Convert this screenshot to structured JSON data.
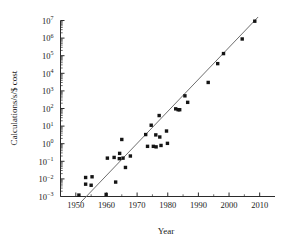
{
  "chart_data": {
    "type": "scatter",
    "title": "",
    "xlabel": "Year",
    "ylabel": "Calculations/s/$ cost",
    "xlim": [
      1945,
      2015
    ],
    "ylim_exp": [
      -3,
      7
    ],
    "yscale": "log",
    "grid": false,
    "legend": "none",
    "x_ticks": [
      1950,
      1960,
      1970,
      1980,
      1990,
      2000,
      2010
    ],
    "x_tick_labels": [
      "1950",
      "1960",
      "1970",
      "1980",
      "1990",
      "2000",
      "2010"
    ],
    "y_ticks_exp": [
      -3,
      -2,
      -1,
      0,
      1,
      2,
      3,
      4,
      5,
      6,
      7
    ],
    "y_tick_labels": [
      "10⁻³",
      "10⁻²",
      "10⁻¹",
      "10⁰",
      "10¹",
      "10²",
      "10³",
      "10⁴",
      "10⁵",
      "10⁶",
      "10⁷"
    ],
    "y_tick_mantissa": "10",
    "y_tick_exponents": [
      "-3",
      "-2",
      "-1",
      "0",
      "1",
      "2",
      "3",
      "4",
      "5",
      "6",
      "7"
    ],
    "marker_color": "#141414",
    "marker_shape": "square",
    "line_color": "#6e6e6e",
    "trendline": {
      "x1": 1951.5,
      "y1_exp": -3.35,
      "x2": 2009.5,
      "y2_exp": 7.2
    },
    "points": [
      {
        "x": 1951.0,
        "y_exp": -2.92
      },
      {
        "x": 1953.2,
        "y_exp": -1.92
      },
      {
        "x": 1953.2,
        "y_exp": -2.3
      },
      {
        "x": 1955.3,
        "y_exp": -1.88
      },
      {
        "x": 1955.0,
        "y_exp": -2.36
      },
      {
        "x": 1959.9,
        "y_exp": -2.88
      },
      {
        "x": 1960.3,
        "y_exp": -0.82
      },
      {
        "x": 1962.5,
        "y_exp": -0.78
      },
      {
        "x": 1963.0,
        "y_exp": -2.18
      },
      {
        "x": 1964.2,
        "y_exp": -0.85
      },
      {
        "x": 1964.3,
        "y_exp": -0.55
      },
      {
        "x": 1965.4,
        "y_exp": -0.82
      },
      {
        "x": 1965.0,
        "y_exp": 0.24
      },
      {
        "x": 1966.2,
        "y_exp": -1.35
      },
      {
        "x": 1967.8,
        "y_exp": -0.7
      },
      {
        "x": 1972.8,
        "y_exp": 0.52
      },
      {
        "x": 1973.4,
        "y_exp": -0.15
      },
      {
        "x": 1974.6,
        "y_exp": 1.05
      },
      {
        "x": 1975.3,
        "y_exp": -0.15
      },
      {
        "x": 1976.1,
        "y_exp": 0.5
      },
      {
        "x": 1976.2,
        "y_exp": -0.18
      },
      {
        "x": 1977.2,
        "y_exp": 1.6
      },
      {
        "x": 1977.4,
        "y_exp": 0.38
      },
      {
        "x": 1977.8,
        "y_exp": -0.1
      },
      {
        "x": 1979.6,
        "y_exp": 0.72
      },
      {
        "x": 1979.9,
        "y_exp": 0.02
      },
      {
        "x": 1982.6,
        "y_exp": 1.98
      },
      {
        "x": 1983.4,
        "y_exp": 1.93
      },
      {
        "x": 1983.9,
        "y_exp": 1.93
      },
      {
        "x": 1985.6,
        "y_exp": 2.72
      },
      {
        "x": 1986.5,
        "y_exp": 2.35
      },
      {
        "x": 1993.2,
        "y_exp": 3.48
      },
      {
        "x": 1996.3,
        "y_exp": 4.55
      },
      {
        "x": 1998.2,
        "y_exp": 5.12
      },
      {
        "x": 2004.3,
        "y_exp": 5.95
      },
      {
        "x": 2008.4,
        "y_exp": 6.96
      }
    ]
  }
}
